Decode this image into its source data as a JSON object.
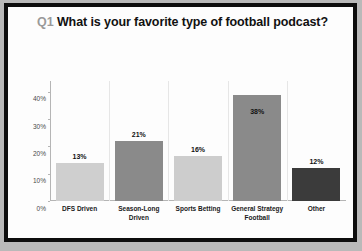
{
  "chart_data": {
    "type": "bar",
    "title": "Q1 What is your favorite type of football podcast?",
    "title_prefix": "Q1",
    "title_main": "What is your favorite type of football podcast?",
    "categories": [
      "DFS Driven",
      "Season-Long Driven",
      "Sports Betting",
      "General Strategy Football",
      "Other"
    ],
    "values": [
      13,
      21,
      16,
      38,
      12
    ],
    "data_labels": [
      "13%",
      "21%",
      "16%",
      "38%",
      "12%"
    ],
    "bar_pixel_values": [
      14,
      22,
      16.5,
      39,
      12
    ],
    "bar_colors": [
      "#cfcfcf",
      "#8a8a8a",
      "#cdcdcd",
      "#8a8a8a",
      "#3b3b3b"
    ],
    "xlabel": "",
    "ylabel": "",
    "ylim": [
      0,
      44
    ],
    "yticks": [
      0,
      10,
      20,
      30,
      40
    ],
    "ytick_labels": [
      "0%",
      "10%",
      "20%",
      "30%",
      "40%"
    ],
    "grid": false,
    "legend": false,
    "legend_position": "none",
    "axis_color": "#b5b5b5",
    "label_color": "#4a4a4a"
  },
  "frame": {
    "border_color": "#0d0d0d",
    "background_color": "#fdfdfd",
    "outer_background": "#b9b9b9"
  }
}
